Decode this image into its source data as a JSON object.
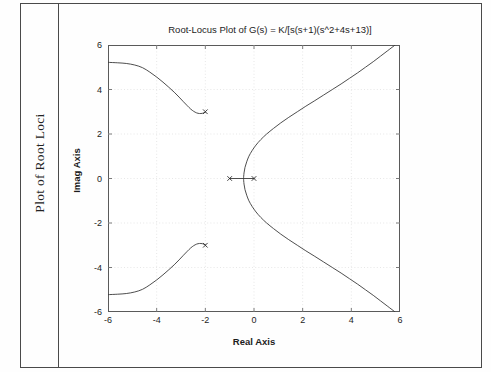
{
  "page": {
    "margin_caption": "Plot of Root Loci"
  },
  "chart_data": {
    "type": "line",
    "title": "Root-Locus Plot of G(s) = K/[s(s+1)(s^2+4s+13)]",
    "xlabel": "Real Axis",
    "ylabel": "Imag Axis",
    "xlim": [
      -6,
      6
    ],
    "ylim": [
      -6,
      6
    ],
    "xticks": [
      -6,
      -4,
      -2,
      0,
      2,
      4,
      6
    ],
    "yticks": [
      -6,
      -4,
      -2,
      0,
      2,
      4,
      6
    ],
    "xticklabels": [
      "-6",
      "-4",
      "-2",
      "0",
      "2",
      "4",
      "6"
    ],
    "yticklabels": [
      "-6",
      "-4",
      "-2",
      "0",
      "2",
      "4",
      "6"
    ],
    "grid": true,
    "grid_style": "dotted",
    "grid_color": "#dcdcdc",
    "axis_color": "#5a5a5a",
    "line_color": "#3a3a3a",
    "legend": null,
    "markers": {
      "name": "open-loop-poles",
      "symbol": "x",
      "points": [
        {
          "x": 0,
          "y": 0
        },
        {
          "x": -1,
          "y": 0
        },
        {
          "x": -2,
          "y": 3
        },
        {
          "x": -2,
          "y": -3
        }
      ]
    },
    "series": [
      {
        "name": "real-axis-segment",
        "comment": "locus on real axis between poles at -1 and 0",
        "points": [
          [
            -1,
            0
          ],
          [
            0,
            0
          ]
        ]
      },
      {
        "name": "breakaway-branch-upper-right",
        "comment": "branch leaving real axis near -0.43 curving up and right to +6 imag",
        "points": [
          [
            -0.43,
            0.0
          ],
          [
            -0.41,
            0.25
          ],
          [
            -0.37,
            0.5
          ],
          [
            -0.3,
            0.75
          ],
          [
            -0.21,
            1.0
          ],
          [
            -0.08,
            1.25
          ],
          [
            0.08,
            1.5
          ],
          [
            0.28,
            1.75
          ],
          [
            0.52,
            2.0
          ],
          [
            0.8,
            2.25
          ],
          [
            1.1,
            2.5
          ],
          [
            1.43,
            2.75
          ],
          [
            1.78,
            3.0
          ],
          [
            2.13,
            3.25
          ],
          [
            2.5,
            3.5
          ],
          [
            2.86,
            3.75
          ],
          [
            3.22,
            4.0
          ],
          [
            3.58,
            4.25
          ],
          [
            3.92,
            4.5
          ],
          [
            4.26,
            4.75
          ],
          [
            4.58,
            5.0
          ],
          [
            4.9,
            5.25
          ],
          [
            5.2,
            5.5
          ],
          [
            5.5,
            5.75
          ],
          [
            5.8,
            6.0
          ]
        ]
      },
      {
        "name": "breakaway-branch-lower-right",
        "comment": "mirror branch leaving real axis near -0.43 curving down and right to -6 imag",
        "points": [
          [
            -0.43,
            0.0
          ],
          [
            -0.41,
            -0.25
          ],
          [
            -0.37,
            -0.5
          ],
          [
            -0.3,
            -0.75
          ],
          [
            -0.21,
            -1.0
          ],
          [
            -0.08,
            -1.25
          ],
          [
            0.08,
            -1.5
          ],
          [
            0.28,
            -1.75
          ],
          [
            0.52,
            -2.0
          ],
          [
            0.8,
            -2.25
          ],
          [
            1.1,
            -2.5
          ],
          [
            1.43,
            -2.75
          ],
          [
            1.78,
            -3.0
          ],
          [
            2.13,
            -3.25
          ],
          [
            2.5,
            -3.5
          ],
          [
            2.86,
            -3.75
          ],
          [
            3.22,
            -4.0
          ],
          [
            3.58,
            -4.25
          ],
          [
            3.92,
            -4.5
          ],
          [
            4.26,
            -4.75
          ],
          [
            4.58,
            -5.0
          ],
          [
            4.9,
            -5.25
          ],
          [
            5.2,
            -5.5
          ],
          [
            5.5,
            -5.75
          ],
          [
            5.8,
            -6.0
          ]
        ]
      },
      {
        "name": "complex-pole-branch-upper-left",
        "comment": "branch from pole at -2+3j dipping then running out to upper-left asymptote",
        "points": [
          [
            -2.0,
            2.98
          ],
          [
            -2.12,
            2.93
          ],
          [
            -2.24,
            2.92
          ],
          [
            -2.36,
            2.95
          ],
          [
            -2.48,
            3.02
          ],
          [
            -2.6,
            3.12
          ],
          [
            -2.74,
            3.27
          ],
          [
            -2.9,
            3.45
          ],
          [
            -3.08,
            3.66
          ],
          [
            -3.28,
            3.88
          ],
          [
            -3.5,
            4.1
          ],
          [
            -3.74,
            4.33
          ],
          [
            -4.0,
            4.56
          ],
          [
            -4.28,
            4.78
          ],
          [
            -4.58,
            4.98
          ],
          [
            -4.9,
            5.1
          ],
          [
            -5.25,
            5.17
          ],
          [
            -5.6,
            5.2
          ],
          [
            -6.0,
            5.22
          ]
        ]
      },
      {
        "name": "complex-pole-branch-lower-left",
        "comment": "mirror branch from pole at -2-3j running out to lower-left asymptote",
        "points": [
          [
            -2.0,
            -2.98
          ],
          [
            -2.12,
            -2.93
          ],
          [
            -2.24,
            -2.92
          ],
          [
            -2.36,
            -2.95
          ],
          [
            -2.48,
            -3.02
          ],
          [
            -2.6,
            -3.12
          ],
          [
            -2.74,
            -3.27
          ],
          [
            -2.9,
            -3.45
          ],
          [
            -3.08,
            -3.66
          ],
          [
            -3.28,
            -3.88
          ],
          [
            -3.5,
            -4.1
          ],
          [
            -3.74,
            -4.33
          ],
          [
            -4.0,
            -4.56
          ],
          [
            -4.28,
            -4.78
          ],
          [
            -4.58,
            -4.98
          ],
          [
            -4.9,
            -5.1
          ],
          [
            -5.25,
            -5.17
          ],
          [
            -5.6,
            -5.2
          ],
          [
            -6.0,
            -5.22
          ]
        ]
      }
    ]
  }
}
